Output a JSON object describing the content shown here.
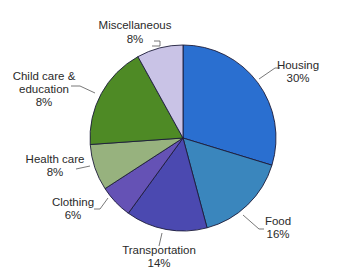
{
  "chart_data": {
    "type": "pie",
    "title": "",
    "categories": [
      "Housing",
      "Food",
      "Transportation",
      "Clothing",
      "Health care",
      "Child care & education",
      "Miscellaneous"
    ],
    "values": [
      30,
      16,
      14,
      6,
      8,
      8,
      8
    ],
    "value_labels": [
      "30%",
      "16%",
      "14%",
      "6%",
      "8%",
      "8%",
      "8%"
    ],
    "label_total_percent": 90,
    "note": "Printed labels sum to 90%. The Child care & education slice is drawn at about 18% of the circle but is labeled 8%; the labeled values are reproduced as shown.",
    "slices": [
      {
        "name": "Housing",
        "label_lines": [
          "Housing",
          "30%"
        ],
        "value": 30,
        "start_deg": 0,
        "end_deg": 107,
        "color": "#2a6fd0"
      },
      {
        "name": "Food",
        "label_lines": [
          "Food",
          "16%"
        ],
        "value": 16,
        "start_deg": 107,
        "end_deg": 165,
        "color": "#3a86bd"
      },
      {
        "name": "Transportation",
        "label_lines": [
          "Transportation",
          "14%"
        ],
        "value": 14,
        "start_deg": 165,
        "end_deg": 216,
        "color": "#4b49b0"
      },
      {
        "name": "Clothing",
        "label_lines": [
          "Clothing",
          "6%"
        ],
        "value": 6,
        "start_deg": 216,
        "end_deg": 237,
        "color": "#6552b5"
      },
      {
        "name": "Health care",
        "label_lines": [
          "Health care",
          "8%"
        ],
        "value": 8,
        "start_deg": 237,
        "end_deg": 266,
        "color": "#97b27e"
      },
      {
        "name": "Child care & education",
        "label_lines": [
          "Child care &",
          "education",
          "8%"
        ],
        "value": 8,
        "start_deg": 266,
        "end_deg": 331,
        "color": "#4e8a25"
      },
      {
        "name": "Miscellaneous",
        "label_lines": [
          "Miscellaneous",
          "8%"
        ],
        "value": 8,
        "start_deg": 331,
        "end_deg": 360,
        "color": "#c9c3e6"
      }
    ],
    "angle_convention": "start_deg/end_deg are clockwise from 12 o'clock and reflect the slice sizes measured from the image, not the printed percentages",
    "legend": "none (direct labels with leader lines)"
  },
  "labels": {
    "housing": {
      "name": "Housing",
      "pct": "30%"
    },
    "food": {
      "name": "Food",
      "pct": "16%"
    },
    "transportation": {
      "name": "Transportation",
      "pct": "14%"
    },
    "clothing": {
      "name": "Clothing",
      "pct": "6%"
    },
    "health": {
      "name": "Health care",
      "pct": "8%"
    },
    "childcare": {
      "line1": "Child care &",
      "line2": "education",
      "pct": "8%"
    },
    "misc": {
      "name": "Miscellaneous",
      "pct": "8%"
    }
  }
}
